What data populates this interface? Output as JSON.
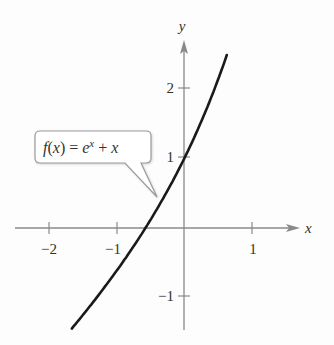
{
  "chart_data": {
    "type": "line",
    "title": "",
    "function_label": "f(x) = e^x + x",
    "function_label_parts": {
      "f": "f",
      "open": "(",
      "x": "x",
      "close": ")",
      "eq": " = ",
      "e": "e",
      "sup": "x",
      "plus": " + ",
      "x2": "x"
    },
    "xlabel": "x",
    "ylabel": "y",
    "xlim": [
      -2.5,
      1.6
    ],
    "ylim": [
      -1.5,
      2.7
    ],
    "x_ticks": [
      -2,
      -1,
      1
    ],
    "x_tick_labels": [
      "−2",
      "−1",
      "1"
    ],
    "y_ticks": [
      -1,
      1,
      2
    ],
    "y_tick_labels": [
      "−1",
      "1",
      "2"
    ],
    "grid": false,
    "series": [
      {
        "name": "f(x) = e^x + x",
        "x": [
          -1.65,
          -1.5,
          -1.25,
          -1.0,
          -0.75,
          -0.57,
          -0.5,
          -0.25,
          0.0,
          0.25,
          0.5,
          0.63
        ],
        "y": [
          -1.46,
          -1.28,
          -0.96,
          -0.63,
          -0.28,
          0.0,
          0.11,
          0.53,
          1.0,
          1.53,
          2.15,
          2.51
        ]
      }
    ],
    "line_color": "#1a1a1a",
    "axis_color": "#888888"
  }
}
